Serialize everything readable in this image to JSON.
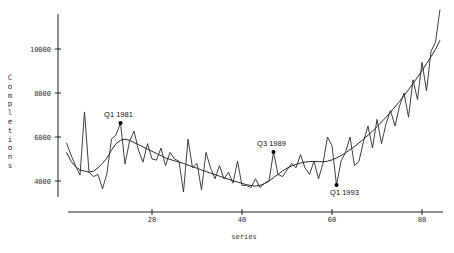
{
  "chart_data": {
    "type": "line",
    "title": "",
    "xlabel": "series",
    "ylabel": "Completions",
    "xlim": [
      1,
      85
    ],
    "ylim": [
      3000,
      12000
    ],
    "grid": false,
    "legend": null,
    "x_ticks": [
      20,
      40,
      60,
      80
    ],
    "y_ticks": [
      4000,
      6000,
      8000,
      10000
    ],
    "x": [
      1,
      2,
      3,
      4,
      5,
      6,
      7,
      8,
      9,
      10,
      11,
      12,
      13,
      14,
      15,
      16,
      17,
      18,
      19,
      20,
      21,
      22,
      23,
      24,
      25,
      26,
      27,
      28,
      29,
      30,
      31,
      32,
      33,
      34,
      35,
      36,
      37,
      38,
      39,
      40,
      41,
      42,
      43,
      44,
      45,
      46,
      47,
      48,
      49,
      50,
      51,
      52,
      53,
      54,
      55,
      56,
      57,
      58,
      59,
      60,
      61,
      62,
      63,
      64,
      65,
      66,
      67,
      68,
      69,
      70,
      71,
      72,
      73,
      74,
      75,
      76,
      77,
      78,
      79,
      80,
      81,
      82,
      83,
      84
    ],
    "series": [
      {
        "name": "Completions",
        "values": [
          5730,
          5180,
          4700,
          4270,
          7140,
          4400,
          4200,
          4300,
          3640,
          4360,
          5910,
          6090,
          6640,
          4770,
          5800,
          6270,
          5400,
          4860,
          5700,
          5000,
          4950,
          5500,
          4700,
          5300,
          5000,
          4900,
          3500,
          5900,
          4600,
          4800,
          3600,
          5300,
          4600,
          4100,
          4700,
          4100,
          4400,
          3900,
          4900,
          3800,
          3800,
          3700,
          4100,
          3700,
          3900,
          4000,
          5320,
          4300,
          4200,
          4500,
          4800,
          4600,
          5200,
          4600,
          4300,
          4900,
          4100,
          4800,
          6000,
          5600,
          3820,
          4900,
          5300,
          6000,
          4700,
          4900,
          5800,
          6500,
          5500,
          6800,
          5700,
          6600,
          7200,
          6500,
          7400,
          8000,
          6900,
          8600,
          7700,
          9400,
          8100,
          9900,
          10300,
          11800
        ]
      },
      {
        "name": "Trend",
        "values": [
          5300,
          4900,
          4650,
          4500,
          4450,
          4400,
          4450,
          4600,
          4800,
          5050,
          5400,
          5700,
          5850,
          5900,
          5850,
          5750,
          5650,
          5550,
          5450,
          5350,
          5250,
          5150,
          5050,
          4980,
          4920,
          4860,
          4800,
          4720,
          4650,
          4580,
          4500,
          4430,
          4360,
          4290,
          4220,
          4150,
          4080,
          4010,
          3950,
          3890,
          3830,
          3790,
          3770,
          3800,
          3880,
          4000,
          4150,
          4300,
          4450,
          4580,
          4680,
          4760,
          4820,
          4860,
          4880,
          4890,
          4880,
          4870,
          4900,
          4960,
          5050,
          5150,
          5280,
          5420,
          5570,
          5730,
          5900,
          6080,
          6270,
          6470,
          6680,
          6900,
          7130,
          7370,
          7620,
          7880,
          8150,
          8430,
          8720,
          9020,
          9330,
          9650,
          9980,
          10400
        ]
      }
    ],
    "annotations": [
      {
        "label": "Q1 1981",
        "x": 13,
        "y": 6640
      },
      {
        "label": "Q3 1989",
        "x": 47,
        "y": 5320
      },
      {
        "label": "Q1 1993",
        "x": 61,
        "y": 3820
      }
    ]
  },
  "axes": {
    "x_title": "series",
    "y_title": "Completions",
    "x_tick_labels": [
      "20",
      "40",
      "60",
      "80"
    ],
    "y_tick_labels": [
      "4000",
      "6000",
      "8000",
      "10000"
    ]
  }
}
